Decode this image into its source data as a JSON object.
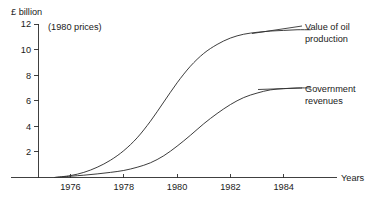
{
  "chart_data": {
    "type": "line",
    "title": "",
    "unit_label": "£ billion",
    "prices_note": "(1980 prices)",
    "xlabel": "Years",
    "ylabel": "",
    "grid": false,
    "legend_position": "inline-annotation",
    "xlim": [
      1974.8,
      1986.0
    ],
    "ylim": [
      0,
      12
    ],
    "y_ticks": [
      2,
      4,
      6,
      8,
      10,
      12
    ],
    "y_tick_labels": [
      "2",
      "4",
      "6",
      "8",
      "10",
      "12"
    ],
    "x_ticks": [
      1976,
      1978,
      1980,
      1982,
      1984
    ],
    "x_tick_labels": [
      "1976",
      "1978",
      "1980",
      "1982",
      "1984"
    ],
    "series": [
      {
        "name": "Value of oil production",
        "annotation": [
          "Value of oil",
          "production"
        ],
        "x": [
          1975.4,
          1976.0,
          1976.5,
          1977.0,
          1977.5,
          1978.0,
          1978.5,
          1979.0,
          1979.5,
          1980.0,
          1980.5,
          1981.0,
          1981.5,
          1982.0,
          1982.5,
          1983.0,
          1983.5,
          1984.0,
          1984.5,
          1985.0
        ],
        "values": [
          0.0,
          0.15,
          0.4,
          0.8,
          1.35,
          2.1,
          3.1,
          4.4,
          5.9,
          7.4,
          8.7,
          9.7,
          10.4,
          10.9,
          11.2,
          11.35,
          11.45,
          11.5,
          11.55,
          11.55
        ]
      },
      {
        "name": "Government revenues",
        "annotation": [
          "Government",
          "revenues"
        ],
        "x": [
          1975.4,
          1976.0,
          1976.5,
          1977.0,
          1977.5,
          1978.0,
          1978.5,
          1979.0,
          1979.5,
          1980.0,
          1980.5,
          1981.0,
          1981.5,
          1982.0,
          1982.5,
          1983.0,
          1983.5,
          1984.0,
          1984.5,
          1985.0
        ],
        "values": [
          0.0,
          0.1,
          0.18,
          0.28,
          0.4,
          0.55,
          0.8,
          1.15,
          1.7,
          2.45,
          3.3,
          4.2,
          5.0,
          5.7,
          6.25,
          6.6,
          6.85,
          6.95,
          7.0,
          7.0
        ]
      }
    ],
    "colors": {
      "line": "#333333",
      "axis": "#2b2b2b",
      "text": "#1a1a1a",
      "background": "#ffffff"
    }
  }
}
